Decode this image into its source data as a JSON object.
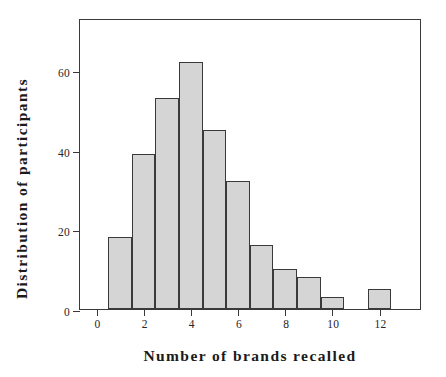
{
  "chart_data": {
    "type": "bar",
    "title": "",
    "subtitle": "",
    "xlabel": "Number of brands recalled",
    "ylabel": "Distribution of participants",
    "xlim": [
      -0.7,
      13.8
    ],
    "ylim": [
      0,
      73
    ],
    "grid": false,
    "legend": null,
    "bin_width": 1,
    "bins": [
      {
        "left": 0.5,
        "right": 1.5,
        "center": 1,
        "value": 18
      },
      {
        "left": 1.5,
        "right": 2.5,
        "center": 2,
        "value": 39
      },
      {
        "left": 2.5,
        "right": 3.5,
        "center": 3,
        "value": 53
      },
      {
        "left": 3.5,
        "right": 4.5,
        "center": 4,
        "value": 62
      },
      {
        "left": 4.5,
        "right": 5.5,
        "center": 5,
        "value": 45
      },
      {
        "left": 5.5,
        "right": 6.5,
        "center": 6,
        "value": 32
      },
      {
        "left": 6.5,
        "right": 7.5,
        "center": 7,
        "value": 16
      },
      {
        "left": 7.5,
        "right": 8.5,
        "center": 8,
        "value": 10
      },
      {
        "left": 8.5,
        "right": 9.5,
        "center": 9,
        "value": 8
      },
      {
        "left": 9.5,
        "right": 10.5,
        "center": 10,
        "value": 3
      },
      {
        "left": 11.5,
        "right": 12.5,
        "center": 12,
        "value": 5
      }
    ],
    "categories": [
      1,
      2,
      3,
      4,
      5,
      6,
      7,
      8,
      9,
      10,
      12
    ],
    "values": [
      18,
      39,
      53,
      62,
      45,
      32,
      16,
      10,
      8,
      3,
      5
    ],
    "x_ticks": [
      {
        "value": 0,
        "label": "0"
      },
      {
        "value": 2,
        "label": "2"
      },
      {
        "value": 4,
        "label": "4"
      },
      {
        "value": 6,
        "label": "6"
      },
      {
        "value": 8,
        "label": "8"
      },
      {
        "value": 10,
        "label": "10"
      },
      {
        "value": 12,
        "label": "12"
      }
    ],
    "y_ticks": [
      {
        "value": 0,
        "label": "0"
      },
      {
        "value": 20,
        "label": "20"
      },
      {
        "value": 40,
        "label": "40"
      },
      {
        "value": 60,
        "label": "60"
      }
    ],
    "colors": {
      "bar_fill": "#d5d5d5",
      "bar_stroke": "#3a3a3a",
      "axis": "#3a3a3a",
      "text": "#1a1a1a",
      "background": "#ffffff"
    }
  }
}
